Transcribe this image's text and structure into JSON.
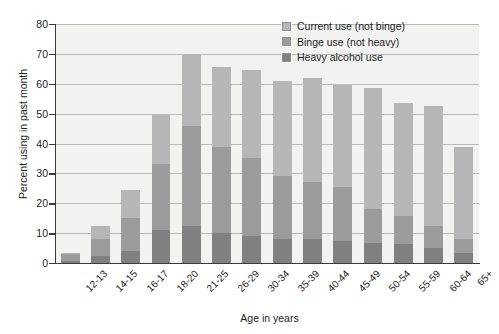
{
  "chart_data": {
    "type": "bar",
    "subtype": "stacked-bar",
    "title": "",
    "xlabel": "Age in years",
    "ylabel": "Percent using in past month",
    "ylim": [
      0,
      80
    ],
    "ytick_step": 10,
    "yticks": [
      0,
      10,
      20,
      30,
      40,
      50,
      60,
      70,
      80
    ],
    "grid": true,
    "legend_position": "top-right",
    "categories": [
      "12-13",
      "14-15",
      "16-17",
      "18-20",
      "21-25",
      "26-29",
      "30-34",
      "35-39",
      "40-44",
      "45-49",
      "50-54",
      "55-59",
      "60-64",
      "65+"
    ],
    "series": [
      {
        "name": "Heavy alcohol use",
        "color": "#808080",
        "values": [
          0.6,
          2.5,
          4.1,
          11.0,
          12.5,
          10.1,
          8.9,
          8.2,
          7.9,
          7.4,
          6.8,
          6.3,
          5.0,
          3.5
        ]
      },
      {
        "name": "Binge use (not heavy)",
        "color": "#9b9b9b",
        "values": [
          2.4,
          5.5,
          10.9,
          22.0,
          33.5,
          28.9,
          26.1,
          20.8,
          19.1,
          18.1,
          11.2,
          9.5,
          7.5,
          4.5
        ]
      },
      {
        "name": "Current use (not binge)",
        "color": "#b6b6b6",
        "values": [
          0.5,
          4.5,
          9.5,
          16.5,
          24.0,
          26.5,
          29.5,
          32.0,
          34.9,
          34.1,
          40.5,
          37.7,
          40.0,
          31.0
        ]
      }
    ],
    "totals": [
      3.5,
      12.5,
      24.5,
      49.5,
      70.0,
      65.5,
      64.5,
      61.0,
      61.9,
      59.6,
      58.5,
      53.5,
      52.5,
      39.0
    ]
  },
  "legend": {
    "items": [
      {
        "label": "Current use (not binge)",
        "color": "#b6b6b6"
      },
      {
        "label": "Binge use (not heavy)",
        "color": "#9b9b9b"
      },
      {
        "label": "Heavy alcohol use",
        "color": "#808080"
      }
    ]
  }
}
